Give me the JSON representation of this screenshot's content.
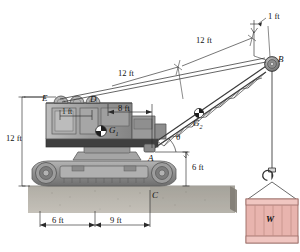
{
  "figure": {
    "type": "engineering-statics-diagram",
    "background_color": "#ffffff"
  },
  "labels": {
    "point_A": "A",
    "point_B": "B",
    "point_C": "C",
    "point_D": "D",
    "point_E": "E",
    "cg_body": "G",
    "cg_body_sub": "1",
    "cg_boom": "G",
    "cg_boom_sub": "2",
    "angle_theta": "θ",
    "load_W": "W"
  },
  "dimensions": {
    "boom_upper_segment": "12 ft",
    "boom_lower_segment": "12 ft",
    "boom_tip_offset": "1 ft",
    "cab_top_width": "1 ft",
    "cab_to_pivot": "8 ft",
    "mast_height": "12 ft",
    "pivot_height": "6 ft",
    "track_left": "6 ft",
    "track_right": "9 ft"
  },
  "colors": {
    "machine_body": "#9a9a9a",
    "machine_dark": "#4a4a4a",
    "machine_light": "#c8c8c8",
    "ground": "#a8a49c",
    "crate_fill": "#e8b4ae",
    "crate_edge": "#d09a93",
    "line": "#2b2b2b",
    "boom_line": "#3a3a3a"
  }
}
